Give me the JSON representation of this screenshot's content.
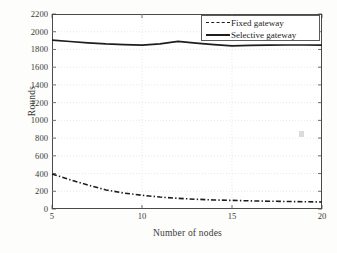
{
  "chart_data": {
    "type": "line",
    "title": "",
    "xlabel": "Number of nodes",
    "ylabel": "Rounds",
    "xlim": [
      5,
      20
    ],
    "ylim": [
      0,
      2200
    ],
    "xticks": [
      5,
      10,
      15,
      20
    ],
    "yticks": [
      0,
      200,
      400,
      600,
      800,
      1000,
      1200,
      1400,
      1600,
      1800,
      2000,
      2200
    ],
    "grid": true,
    "legend_position": "top-right",
    "x": [
      5,
      6,
      7,
      8,
      9,
      10,
      11,
      12,
      13,
      14,
      15,
      16,
      17,
      18,
      19,
      20
    ],
    "series": [
      {
        "name": "Fixed gateway",
        "style": "dash-dot",
        "color": "#1d1d1d",
        "values": [
          395,
          330,
          270,
          215,
          180,
          155,
          135,
          120,
          110,
          102,
          97,
          92,
          88,
          85,
          82,
          79
        ]
      },
      {
        "name": "Selective gateway",
        "style": "solid",
        "color": "#1d1d1d",
        "values": [
          1905,
          1890,
          1875,
          1862,
          1855,
          1848,
          1862,
          1890,
          1872,
          1855,
          1840,
          1845,
          1848,
          1850,
          1850,
          1848
        ]
      }
    ]
  },
  "axes": {
    "ylabel": "Rounds",
    "xlabel": "Number of nodes",
    "ytick_labels": [
      "2200",
      "2000",
      "1800",
      "1600",
      "1400",
      "1200",
      "1000",
      "800",
      "600",
      "400",
      "200",
      "0"
    ],
    "xtick_labels": [
      "5",
      "10",
      "15",
      "20"
    ]
  },
  "legend": {
    "entries": [
      {
        "label": "Fixed gateway",
        "sample": "dash-dot-line-sample"
      },
      {
        "label": "Selective gateway",
        "sample": "solid-line-sample"
      }
    ]
  }
}
